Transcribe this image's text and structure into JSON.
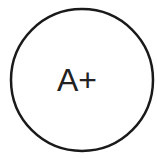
{
  "badge": {
    "text": "A+",
    "shape": "circle",
    "stroke_color": "#1a1a1a",
    "fill_color": "#ffffff",
    "text_color": "#222222"
  }
}
